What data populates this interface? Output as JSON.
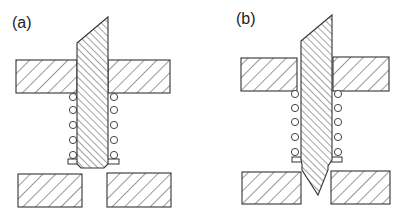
{
  "figure": {
    "panels": [
      {
        "id": "a",
        "label": "(a)",
        "description": "Spring-loaded pin retracted; pin tip above lower plates"
      },
      {
        "id": "b",
        "label": "(b)",
        "description": "Pin pushed down; pointed tip passes between lower plates"
      }
    ],
    "parts": {
      "upper_plate": "hatched fixed upper plate (split around pin)",
      "pin": "densely hatched pin with slanted top",
      "spring": "coil spring shown as circles on both sides of pin",
      "lower_plates": "two hatched lower plates with gap"
    },
    "colors": {
      "stroke": "#333333",
      "background": "#ffffff"
    }
  }
}
